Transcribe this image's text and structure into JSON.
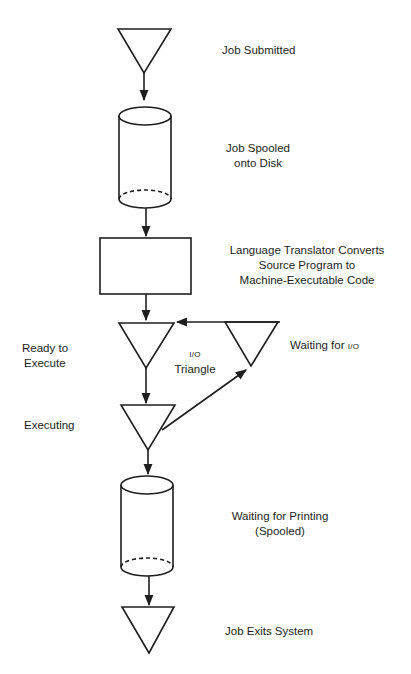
{
  "diagram": {
    "type": "job-flow-through-system",
    "stroke_color": "#1e1e1e",
    "nodes": [
      {
        "id": "job-submitted",
        "shape": "triangle",
        "label": "Job Submitted"
      },
      {
        "id": "job-spooled",
        "shape": "cylinder",
        "label_line1": "Job Spooled",
        "label_line2": "onto Disk"
      },
      {
        "id": "language-translator",
        "shape": "rectangle",
        "label_line1": "Language Translator Converts",
        "label_line2": "Source Program to",
        "label_line3": "Machine-Executable Code"
      },
      {
        "id": "ready-to-execute",
        "shape": "triangle",
        "label_line1": "Ready to",
        "label_line2": "Execute"
      },
      {
        "id": "waiting-for-io",
        "shape": "triangle",
        "label_prefix": "Waiting for ",
        "label_io": "I/O"
      },
      {
        "id": "executing",
        "shape": "triangle",
        "label": "Executing"
      },
      {
        "id": "waiting-for-printing",
        "shape": "cylinder",
        "label_line1": "Waiting for Printing",
        "label_line2": "(Spooled)"
      },
      {
        "id": "job-exits",
        "shape": "triangle",
        "label": "Job Exits System"
      }
    ],
    "io_triangle_label": {
      "line1": "I/O",
      "line2": "Triangle"
    },
    "edges": [
      {
        "from": "job-submitted",
        "to": "job-spooled"
      },
      {
        "from": "job-spooled",
        "to": "language-translator"
      },
      {
        "from": "language-translator",
        "to": "ready-to-execute"
      },
      {
        "from": "ready-to-execute",
        "to": "executing"
      },
      {
        "from": "executing",
        "to": "waiting-for-io"
      },
      {
        "from": "waiting-for-io",
        "to": "ready-to-execute"
      },
      {
        "from": "executing",
        "to": "waiting-for-printing"
      },
      {
        "from": "waiting-for-printing",
        "to": "job-exits"
      }
    ]
  }
}
